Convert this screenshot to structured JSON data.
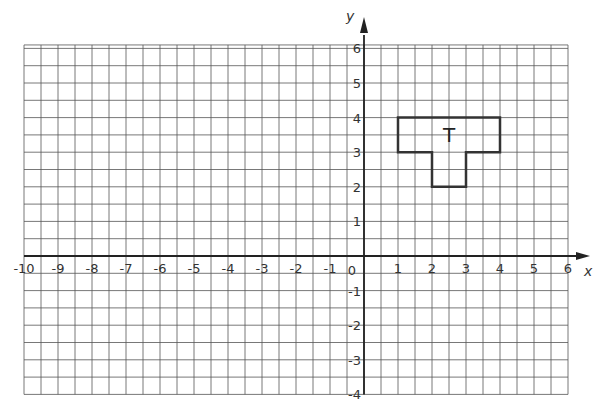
{
  "chart_data": {
    "type": "coordinate-grid",
    "title": "",
    "xlabel": "x",
    "ylabel": "y",
    "xlim": [
      -10,
      6
    ],
    "ylim": [
      -4,
      6
    ],
    "grid": {
      "on": true,
      "minor_step": 0.5,
      "major_step": 1
    },
    "x_tick_labels": [
      "-10",
      "-9",
      "-8",
      "-7",
      "-6",
      "-5",
      "-4",
      "-3",
      "-2",
      "-1",
      "0",
      "1",
      "2",
      "3",
      "4",
      "5",
      "6"
    ],
    "y_tick_labels": [
      "-4",
      "-3",
      "-2",
      "-1",
      "1",
      "2",
      "3",
      "4",
      "5",
      "6"
    ],
    "shapes": [
      {
        "name": "T",
        "label": "T",
        "vertices": [
          [
            1,
            4
          ],
          [
            4,
            4
          ],
          [
            4,
            3
          ],
          [
            3,
            3
          ],
          [
            3,
            2
          ],
          [
            2,
            2
          ],
          [
            2,
            3
          ],
          [
            1,
            3
          ]
        ],
        "label_position": [
          2.5,
          3.5
        ]
      }
    ]
  },
  "labels": {
    "x_axis": "x",
    "y_axis": "y",
    "origin": "0",
    "shape": "T"
  }
}
